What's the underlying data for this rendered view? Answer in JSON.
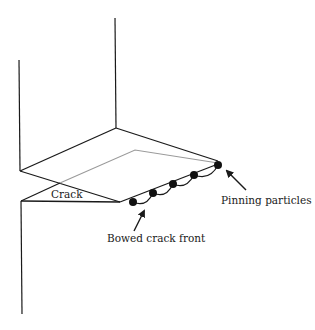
{
  "diagram": {
    "labels": {
      "crack": "Crack",
      "pinning_particles": "Pinning particles",
      "bowed_crack_front": "Bowed crack front"
    },
    "colors": {
      "line": "#1a1a1a",
      "hidden_edge": "#9a9a9a",
      "particle": "#111111",
      "background": "#ffffff"
    },
    "particle_count": 5
  }
}
